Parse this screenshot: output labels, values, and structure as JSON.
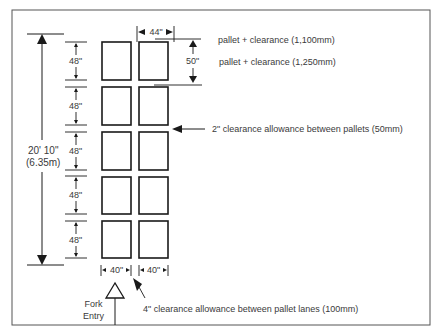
{
  "diagram": {
    "overall_length": {
      "imperial": "20' 10\"",
      "metric": "(6.35m)"
    },
    "row_pitch_labels": [
      "48\"",
      "48\"",
      "48\"",
      "48\"",
      "48\""
    ],
    "lane_width_top": "44\"",
    "row_depth_right": "50\"",
    "pallet_width_labels": [
      "40\"",
      "40\""
    ],
    "notes": {
      "lane_width": "pallet   + clearance (1,100mm)",
      "row_depth": "pallet  +  clearance (1,250mm)",
      "pallet_clearance": "2\" clearance allowance between pallets (50mm)",
      "lane_clearance": "4\" clearance allowance between pallet lanes (100mm)"
    },
    "fork_entry": {
      "line1": "Fork",
      "line2": "Entry"
    },
    "pallet_grid": {
      "columns": 2,
      "rows": 5
    },
    "colors": {
      "line": "#1a1a1a",
      "text": "#3a3a3a",
      "border": "#555555"
    }
  }
}
